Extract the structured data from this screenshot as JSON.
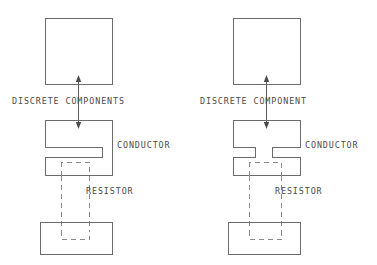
{
  "figure": {
    "background_color": "#ffffff",
    "line_color": "#6b6b6b",
    "dashed_color": "#8a8a8a",
    "text_color": "#4a4a4a",
    "width": 377,
    "height": 265
  },
  "panels": [
    {
      "id": "left",
      "callout_label": "DISCRETE COMPONENTS",
      "conductor_label": "CONDUCTOR",
      "resistor_label": "RESISTOR",
      "top_box": {
        "x": 45,
        "y": 18,
        "w": 68,
        "h": 67
      },
      "middle_shape": {
        "x": 45,
        "y": 120,
        "w": 68,
        "h": 55,
        "notch_side": "left"
      },
      "bottom_box": {
        "x": 40,
        "y": 222,
        "w": 73,
        "h": 33
      },
      "arrow": {
        "x": 78,
        "y_top": 76,
        "y_bottom": 127
      },
      "callout_text_pos": {
        "x": 12,
        "y": 104
      },
      "conductor_text_pos": {
        "x": 117,
        "y": 148
      },
      "resistor_text_pos": {
        "x": 86,
        "y": 194
      }
    },
    {
      "id": "right",
      "callout_label": "DISCRETE COMPONENT",
      "conductor_label": "CONDUCTOR",
      "resistor_label": "RESISTOR",
      "top_box": {
        "x": 233,
        "y": 18,
        "w": 68,
        "h": 67
      },
      "middle_shape": {
        "x": 233,
        "y": 120,
        "w": 68,
        "h": 55,
        "notch_side": "center"
      },
      "bottom_box": {
        "x": 228,
        "y": 222,
        "w": 73,
        "h": 33
      },
      "arrow": {
        "x": 266,
        "y_top": 76,
        "y_bottom": 127
      },
      "callout_text_pos": {
        "x": 200,
        "y": 104
      },
      "conductor_text_pos": {
        "x": 305,
        "y": 148
      },
      "resistor_text_pos": {
        "x": 275,
        "y": 194
      }
    }
  ],
  "labels": {
    "left_callout": "DISCRETE COMPONENTS",
    "left_conductor": "CONDUCTOR",
    "left_resistor": "RESISTOR",
    "right_callout": "DISCRETE COMPONENT",
    "right_conductor": "CONDUCTOR",
    "right_resistor": "RESISTOR"
  }
}
